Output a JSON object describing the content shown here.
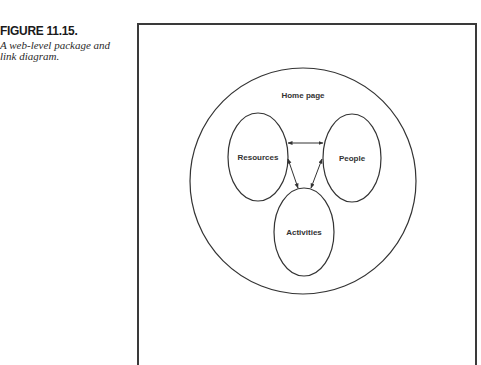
{
  "figure": {
    "number": "FIGURE 11.15.",
    "description_line1": "A web-level package and",
    "description_line2": "link diagram."
  },
  "diagram": {
    "container": {
      "label": "Home page",
      "shape": "circle",
      "cx": 303,
      "cy": 181,
      "r": 113
    },
    "nodes": [
      {
        "id": "resources",
        "label": "Resources",
        "shape": "ellipse",
        "cx": 258,
        "cy": 157,
        "rx": 30,
        "ry": 44
      },
      {
        "id": "people",
        "label": "People",
        "shape": "ellipse",
        "cx": 352,
        "cy": 158,
        "rx": 29,
        "ry": 44
      },
      {
        "id": "activities",
        "label": "Activities",
        "shape": "ellipse",
        "cx": 304,
        "cy": 232,
        "rx": 30,
        "ry": 44
      }
    ],
    "links": [
      {
        "from": "resources",
        "to": "people",
        "type": "bidirectional"
      },
      {
        "from": "resources",
        "to": "activities",
        "type": "bidirectional"
      },
      {
        "from": "people",
        "to": "activities",
        "type": "bidirectional"
      }
    ],
    "colors": {
      "stroke": "#333333",
      "background": "#ffffff"
    }
  }
}
